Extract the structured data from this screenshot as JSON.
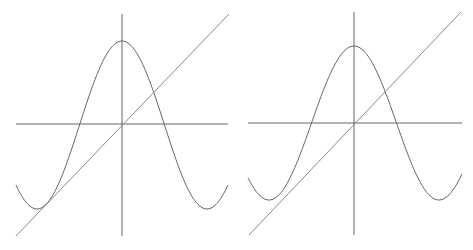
{
  "figure": {
    "colors": {
      "axis": "#555555",
      "curve": "#666666",
      "line": "#8a8a8a",
      "background": "#ffffff"
    }
  },
  "panels": [
    {
      "id": "left",
      "origin": [
        122,
        124
      ],
      "x_axis": [
        16,
        228
      ],
      "y_axis": [
        14,
        236
      ],
      "curve": {
        "x_start": 16,
        "x_end": 228,
        "peak_y": 41,
        "min_y": 209,
        "half_period": 85
      },
      "line": {
        "from": [
          16,
          236
        ],
        "to": [
          229,
          14
        ]
      },
      "note": "line tangent to the curve near its left minimum"
    },
    {
      "id": "right",
      "origin": [
        354,
        123
      ],
      "x_axis": [
        248,
        462
      ],
      "y_axis": [
        12,
        235
      ],
      "curve": {
        "x_start": 248,
        "x_end": 462,
        "peak_y": 46,
        "min_y": 200,
        "half_period": 85
      },
      "line": {
        "from": [
          249,
          235
        ],
        "to": [
          461,
          12
        ]
      },
      "note": "line passes below the left minimum without touching"
    }
  ]
}
